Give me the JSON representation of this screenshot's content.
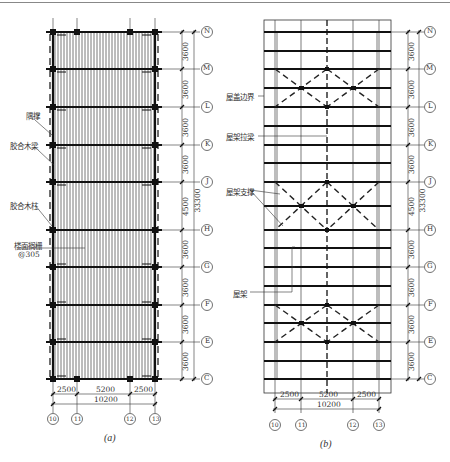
{
  "figure_a": {
    "caption": "(a)",
    "labels": {
      "brace": "隅撑",
      "glulam_beam": "胶合木梁",
      "glulam_column": "胶合木柱",
      "floor_joist": "楼面搁栅",
      "joist_spacing": "@305"
    }
  },
  "figure_b": {
    "caption": "(b)",
    "labels": {
      "roof_boundary": "屋盖边界",
      "truss_tie_beam": "屋架拉梁",
      "truss_bracing": "屋架支撑",
      "roof_truss": "屋架"
    }
  },
  "axes": {
    "rows": [
      "N",
      "M",
      "L",
      "K",
      "J",
      "H",
      "G",
      "F",
      "E",
      "C"
    ],
    "columns": [
      "10",
      "11",
      "12",
      "13"
    ]
  },
  "dimensions": {
    "row_spacings": [
      "3600",
      "3600",
      "3600",
      "3600",
      "4500",
      "3600",
      "3600",
      "3600",
      "3600"
    ],
    "total_length": "33300",
    "column_spacings": [
      "2500",
      "5200",
      "2500"
    ],
    "total_width": "10200"
  }
}
